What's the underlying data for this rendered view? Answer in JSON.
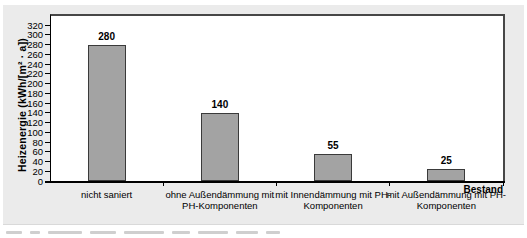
{
  "chart_data": {
    "type": "bar",
    "title": "",
    "xlabel": "",
    "ylabel": "Heizenergie (kWh/[m² · a])",
    "ylim": [
      0,
      320
    ],
    "ytick_step": 20,
    "yticks": [
      0,
      20,
      40,
      60,
      80,
      100,
      120,
      140,
      160,
      180,
      200,
      220,
      240,
      260,
      280,
      300,
      320
    ],
    "categories": [
      {
        "lines": [
          "nicht saniert"
        ]
      },
      {
        "lines": [
          "ohne Außendämmung mit",
          "PH-Komponenten"
        ]
      },
      {
        "lines": [
          "mit Innendämmung mit PH-",
          "Komponenten"
        ]
      },
      {
        "lines": [
          "mit Außendämmung mit PH-",
          "Komponenten"
        ]
      }
    ],
    "values": [
      280,
      140,
      55,
      25
    ],
    "value_labels": [
      "280",
      "140",
      "55",
      "25"
    ],
    "annotations": [
      "Bestand"
    ],
    "legend": null,
    "grid": false,
    "colors": {
      "bar_fill": "#a3a3a3",
      "bar_border": "#3a3a3a",
      "axis": "#000000",
      "frame": "#474747",
      "panel_bg": "#ebebeb",
      "plot_bg": "#ffffff"
    }
  }
}
